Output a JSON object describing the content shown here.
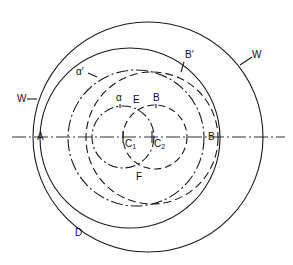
{
  "diagram": {
    "type": "geometric construction",
    "axis": {
      "y": 137,
      "x1": 12,
      "x2": 285,
      "style": "dash-dot"
    },
    "circles": [
      {
        "name": "W",
        "cx": 148,
        "cy": 137,
        "r": 115,
        "style": "solid"
      },
      {
        "name": "inner-solid",
        "cx": 130,
        "cy": 138,
        "r": 90,
        "style": "solid"
      },
      {
        "name": "alpha-prime",
        "cx": 136,
        "cy": 138,
        "r": 68,
        "style": "dash-dot"
      },
      {
        "name": "B-prime",
        "cx": 152,
        "cy": 138,
        "r": 66,
        "style": "dashed"
      },
      {
        "name": "alpha",
        "cx": 123,
        "cy": 137,
        "r": 31,
        "style": "dash-dot"
      },
      {
        "name": "B",
        "cx": 155,
        "cy": 137,
        "r": 32,
        "style": "dashed"
      }
    ],
    "labels": {
      "W_left": "W",
      "W_right": "W",
      "alpha_prime": "α′",
      "B_prime": "B′",
      "alpha": "α",
      "E": "E",
      "B": "B",
      "A": "A",
      "C1": "C",
      "C1_sub": "1",
      "C2": "C",
      "C2_sub": "2",
      "B_axis": "B",
      "F": "F",
      "D": "D"
    }
  }
}
